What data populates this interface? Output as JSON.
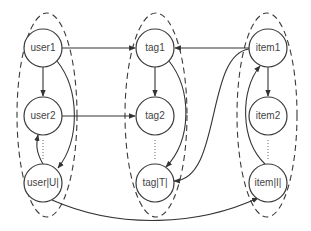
{
  "diagram": {
    "title": "",
    "groups": [
      {
        "id": "users",
        "cx": 47,
        "cy": 115,
        "rx": 30,
        "ry": 102
      },
      {
        "id": "tags",
        "cx": 156,
        "cy": 115,
        "rx": 31,
        "ry": 102
      },
      {
        "id": "items",
        "cx": 267,
        "cy": 115,
        "rx": 30,
        "ry": 102
      }
    ],
    "nodes": [
      {
        "id": "user1",
        "label": "user1",
        "x": 43,
        "y": 48
      },
      {
        "id": "user2",
        "label": "user2",
        "x": 43,
        "y": 116
      },
      {
        "id": "userU",
        "label": "user|U|",
        "x": 43,
        "y": 183
      },
      {
        "id": "tag1",
        "label": "tag1",
        "x": 155,
        "y": 48
      },
      {
        "id": "tag2",
        "label": "tag2",
        "x": 155,
        "y": 116
      },
      {
        "id": "tagT",
        "label": "tag|T|",
        "x": 155,
        "y": 183
      },
      {
        "id": "item1",
        "label": "item1",
        "x": 268,
        "y": 48
      },
      {
        "id": "item2",
        "label": "item2",
        "x": 268,
        "y": 116
      },
      {
        "id": "itemI",
        "label": "item|I|",
        "x": 268,
        "y": 183
      }
    ],
    "edges": [
      {
        "from": "user1",
        "to": "tag1"
      },
      {
        "from": "user2",
        "to": "tag2"
      },
      {
        "from": "user1",
        "to": "user2"
      },
      {
        "from": "user1",
        "to": "userU"
      },
      {
        "from": "userU",
        "to": "user2"
      },
      {
        "from": "userU",
        "to": "itemI"
      },
      {
        "from": "tag1",
        "to": "tag2"
      },
      {
        "from": "tag1",
        "to": "tagT"
      },
      {
        "from": "item1",
        "to": "tag1"
      },
      {
        "from": "item1",
        "to": "tagT"
      },
      {
        "from": "item1",
        "to": "item2"
      },
      {
        "from": "itemI",
        "to": "item1"
      }
    ],
    "ellipsis": "......"
  }
}
